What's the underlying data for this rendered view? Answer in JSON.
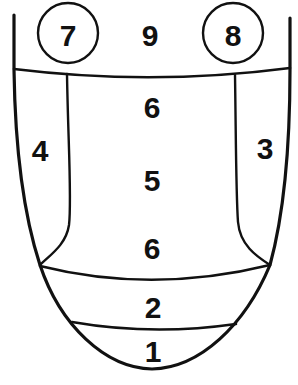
{
  "diagram": {
    "type": "tongue-zone-map",
    "background": "#ffffff",
    "stroke_color": "#111111",
    "zones": [
      {
        "id": "zone-7",
        "label": "7",
        "x": 68,
        "y": 35,
        "circled": true
      },
      {
        "id": "zone-9",
        "label": "9",
        "x": 150,
        "y": 35,
        "circled": false
      },
      {
        "id": "zone-8",
        "label": "8",
        "x": 233,
        "y": 35,
        "circled": true
      },
      {
        "id": "zone-6-top",
        "label": "6",
        "x": 152,
        "y": 107,
        "circled": false
      },
      {
        "id": "zone-4",
        "label": "4",
        "x": 40,
        "y": 150,
        "circled": false
      },
      {
        "id": "zone-3",
        "label": "3",
        "x": 265,
        "y": 148,
        "circled": false
      },
      {
        "id": "zone-5",
        "label": "5",
        "x": 152,
        "y": 180,
        "circled": false
      },
      {
        "id": "zone-6-bottom",
        "label": "6",
        "x": 152,
        "y": 248,
        "circled": false
      },
      {
        "id": "zone-2",
        "label": "2",
        "x": 153,
        "y": 307,
        "circled": false
      },
      {
        "id": "zone-1",
        "label": "1",
        "x": 153,
        "y": 351,
        "circled": false
      }
    ]
  }
}
